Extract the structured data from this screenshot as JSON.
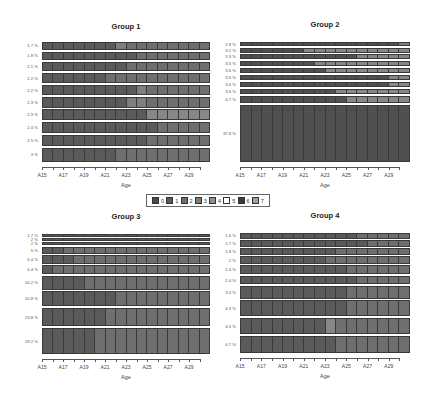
{
  "chart_data": [
    {
      "type": "heatmap",
      "subtype": "sequence-index-plot",
      "title": "Group 1",
      "xlabel": "Age",
      "ylabel": "",
      "x_tick_labels": [
        "A15",
        "A17",
        "A19",
        "A21",
        "A23",
        "A25",
        "A27",
        "A29"
      ],
      "x": [
        "A15",
        "A16",
        "A17",
        "A18",
        "A19",
        "A20",
        "A21",
        "A22",
        "A23",
        "A24",
        "A25",
        "A26",
        "A27",
        "A28",
        "A29",
        "A30"
      ],
      "row_labels": [
        "1.7 %",
        "1.8 %",
        "2.1 %",
        "2.2 %",
        "2.2 %",
        "2.3 %",
        "2.3 %",
        "2.4 %",
        "2.5 %",
        "3 %"
      ],
      "row_weights": [
        1.7,
        1.8,
        2.1,
        2.2,
        2.2,
        2.3,
        2.3,
        2.4,
        2.5,
        3.0
      ],
      "sequences": [
        [
          1,
          1,
          1,
          1,
          1,
          1,
          1,
          4,
          2,
          2,
          2,
          2,
          2,
          2,
          2,
          2
        ],
        [
          1,
          1,
          1,
          1,
          1,
          1,
          1,
          1,
          1,
          2,
          2,
          2,
          2,
          2,
          2,
          2
        ],
        [
          1,
          1,
          1,
          1,
          1,
          1,
          1,
          1,
          2,
          2,
          2,
          2,
          2,
          2,
          2,
          2
        ],
        [
          1,
          1,
          1,
          1,
          1,
          1,
          2,
          2,
          2,
          2,
          2,
          2,
          2,
          2,
          2,
          2
        ],
        [
          1,
          1,
          1,
          1,
          1,
          1,
          1,
          1,
          1,
          4,
          2,
          2,
          2,
          2,
          2,
          2
        ],
        [
          1,
          1,
          1,
          1,
          1,
          1,
          1,
          1,
          4,
          4,
          2,
          2,
          2,
          2,
          2,
          2
        ],
        [
          1,
          1,
          1,
          1,
          1,
          1,
          1,
          1,
          1,
          1,
          3,
          3,
          3,
          3,
          3,
          3
        ],
        [
          1,
          1,
          1,
          1,
          1,
          1,
          1,
          1,
          1,
          1,
          1,
          2,
          2,
          2,
          2,
          2
        ],
        [
          1,
          1,
          1,
          1,
          1,
          1,
          1,
          1,
          1,
          1,
          2,
          2,
          2,
          2,
          2,
          2
        ],
        [
          1,
          1,
          1,
          1,
          1,
          1,
          1,
          2,
          2,
          2,
          2,
          2,
          2,
          2,
          2,
          2
        ]
      ]
    },
    {
      "type": "heatmap",
      "subtype": "sequence-index-plot",
      "title": "Group 2",
      "xlabel": "Age",
      "ylabel": "",
      "x_tick_labels": [
        "A15",
        "A17",
        "A19",
        "A21",
        "A23",
        "A25",
        "A27",
        "A29"
      ],
      "x": [
        "A15",
        "A16",
        "A17",
        "A18",
        "A19",
        "A20",
        "A21",
        "A22",
        "A23",
        "A24",
        "A25",
        "A26",
        "A27",
        "A28",
        "A29",
        "A30"
      ],
      "row_labels": [
        "2.8 %",
        "3.2 %",
        "3.3 %",
        "3.5 %",
        "3.6 %",
        "3.6 %",
        "3.6 %",
        "3.6 %",
        "4.7 %",
        "37.8 %"
      ],
      "row_weights": [
        2.8,
        3.2,
        3.3,
        3.5,
        3.6,
        3.6,
        3.6,
        3.6,
        4.7,
        37.8
      ],
      "sequences": [
        [
          0,
          0,
          0,
          0,
          0,
          0,
          0,
          0,
          0,
          0,
          0,
          0,
          0,
          0,
          0,
          4
        ],
        [
          0,
          0,
          0,
          0,
          0,
          0,
          3,
          3,
          3,
          3,
          3,
          3,
          3,
          3,
          3,
          3
        ],
        [
          0,
          0,
          0,
          0,
          0,
          0,
          0,
          0,
          0,
          0,
          0,
          3,
          3,
          3,
          3,
          3
        ],
        [
          0,
          0,
          0,
          0,
          0,
          0,
          0,
          3,
          3,
          3,
          3,
          3,
          3,
          3,
          3,
          3
        ],
        [
          0,
          0,
          0,
          0,
          0,
          0,
          0,
          0,
          3,
          3,
          3,
          3,
          3,
          3,
          3,
          3
        ],
        [
          0,
          0,
          0,
          0,
          0,
          0,
          0,
          0,
          0,
          0,
          0,
          0,
          0,
          0,
          3,
          3
        ],
        [
          0,
          0,
          0,
          0,
          0,
          0,
          0,
          0,
          0,
          0,
          0,
          0,
          0,
          0,
          3,
          3
        ],
        [
          0,
          0,
          0,
          0,
          0,
          0,
          0,
          0,
          0,
          3,
          3,
          3,
          3,
          3,
          3,
          3
        ],
        [
          0,
          0,
          0,
          0,
          0,
          0,
          0,
          0,
          0,
          0,
          3,
          3,
          3,
          3,
          3,
          3
        ],
        [
          0,
          0,
          0,
          0,
          0,
          0,
          0,
          0,
          0,
          0,
          0,
          0,
          0,
          0,
          0,
          0
        ]
      ]
    },
    {
      "type": "heatmap",
      "subtype": "sequence-index-plot",
      "title": "Group 3",
      "xlabel": "Age",
      "ylabel": "",
      "x_tick_labels": [
        "A15",
        "A17",
        "A19",
        "A21",
        "A23",
        "A25",
        "A27",
        "A29"
      ],
      "x": [
        "A15",
        "A16",
        "A17",
        "A18",
        "A19",
        "A20",
        "A21",
        "A22",
        "A23",
        "A24",
        "A25",
        "A26",
        "A27",
        "A28",
        "A29",
        "A30"
      ],
      "row_labels": [
        "1.7 %",
        "2 %",
        "2 %",
        "5 %",
        "6.4 %",
        "6.4 %",
        "10.2 %",
        "10.8 %",
        "13.8 %",
        "19.2 %"
      ],
      "row_weights": [
        1.7,
        2.0,
        2.0,
        5.0,
        6.4,
        6.4,
        10.2,
        10.8,
        13.8,
        19.2
      ],
      "sequences": [
        [
          1,
          1,
          1,
          1,
          1,
          1,
          1,
          1,
          1,
          1,
          1,
          1,
          1,
          1,
          1,
          1
        ],
        [
          1,
          1,
          1,
          1,
          1,
          1,
          1,
          1,
          1,
          1,
          1,
          1,
          1,
          1,
          1,
          1
        ],
        [
          1,
          1,
          1,
          1,
          1,
          1,
          1,
          1,
          1,
          1,
          1,
          1,
          1,
          1,
          1,
          1
        ],
        [
          1,
          1,
          2,
          2,
          2,
          2,
          2,
          2,
          2,
          2,
          2,
          2,
          2,
          2,
          2,
          2
        ],
        [
          1,
          1,
          1,
          2,
          2,
          2,
          2,
          2,
          2,
          2,
          2,
          2,
          2,
          2,
          2,
          2
        ],
        [
          1,
          2,
          2,
          2,
          2,
          2,
          2,
          2,
          2,
          2,
          2,
          2,
          2,
          2,
          2,
          2
        ],
        [
          1,
          1,
          1,
          1,
          2,
          2,
          2,
          2,
          2,
          2,
          2,
          2,
          2,
          2,
          2,
          2
        ],
        [
          1,
          1,
          1,
          1,
          1,
          1,
          1,
          2,
          2,
          2,
          2,
          2,
          2,
          2,
          2,
          2
        ],
        [
          1,
          1,
          1,
          1,
          1,
          1,
          2,
          2,
          2,
          2,
          2,
          2,
          2,
          2,
          2,
          2
        ],
        [
          1,
          1,
          1,
          1,
          1,
          2,
          2,
          2,
          2,
          2,
          2,
          2,
          2,
          2,
          2,
          2
        ]
      ]
    },
    {
      "type": "heatmap",
      "subtype": "sequence-index-plot",
      "title": "Group 4",
      "xlabel": "Age",
      "ylabel": "",
      "x_tick_labels": [
        "A15",
        "A17",
        "A19",
        "A21",
        "A23",
        "A25",
        "A27",
        "A29"
      ],
      "x": [
        "A15",
        "A16",
        "A17",
        "A18",
        "A19",
        "A20",
        "A21",
        "A22",
        "A23",
        "A24",
        "A25",
        "A26",
        "A27",
        "A28",
        "A29",
        "A30"
      ],
      "row_labels": [
        "1.6 %",
        "1.7 %",
        "1.8 %",
        "2 %",
        "2.4 %",
        "2.4 %",
        "3.5 %",
        "4.3 %",
        "4.5 %",
        "4.7 %"
      ],
      "row_weights": [
        1.6,
        1.7,
        1.8,
        2.0,
        2.4,
        2.4,
        3.5,
        4.3,
        4.5,
        4.7
      ],
      "sequences": [
        [
          1,
          1,
          1,
          1,
          1,
          1,
          1,
          1,
          1,
          1,
          1,
          2,
          2,
          2,
          2,
          2
        ],
        [
          1,
          1,
          1,
          1,
          1,
          1,
          1,
          1,
          1,
          1,
          1,
          1,
          2,
          2,
          2,
          2
        ],
        [
          1,
          1,
          1,
          1,
          1,
          1,
          1,
          1,
          1,
          2,
          2,
          2,
          2,
          2,
          2,
          2
        ],
        [
          1,
          1,
          1,
          1,
          1,
          1,
          1,
          1,
          2,
          2,
          2,
          2,
          2,
          2,
          2,
          2
        ],
        [
          1,
          1,
          1,
          1,
          1,
          1,
          1,
          1,
          1,
          1,
          2,
          2,
          2,
          2,
          2,
          2
        ],
        [
          1,
          1,
          1,
          1,
          1,
          1,
          1,
          1,
          1,
          1,
          1,
          2,
          2,
          2,
          2,
          2
        ],
        [
          1,
          1,
          1,
          1,
          1,
          1,
          1,
          1,
          1,
          1,
          2,
          2,
          2,
          2,
          2,
          2
        ],
        [
          1,
          1,
          1,
          1,
          1,
          1,
          1,
          1,
          1,
          1,
          2,
          2,
          2,
          2,
          2,
          2
        ],
        [
          1,
          1,
          1,
          1,
          1,
          1,
          1,
          1,
          3,
          2,
          2,
          2,
          2,
          2,
          2,
          2
        ],
        [
          1,
          1,
          1,
          1,
          1,
          1,
          1,
          1,
          1,
          2,
          2,
          2,
          2,
          2,
          2,
          2
        ]
      ]
    }
  ],
  "legend": {
    "entries": [
      "0",
      "1",
      "2",
      "3",
      "4",
      "5",
      "6",
      "7"
    ],
    "colors": [
      "#4a4a4a",
      "#5a5a5a",
      "#6c6c6c",
      "#7c7c7c",
      "#8f8f8f",
      "#ffffff",
      "#3c3c3c",
      "#a0a0a0"
    ]
  },
  "state_colors": {
    "0": "#505050",
    "1": "#5a5a5a",
    "2": "#6f6f6f",
    "3": "#878787",
    "4": "#7f7f7f"
  }
}
